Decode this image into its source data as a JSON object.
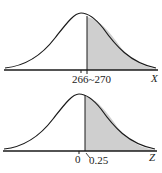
{
  "colors": {
    "curve": "#1a1a1a",
    "shade": "#cfcfcf",
    "axis": "#1a1a1a",
    "background": "#ffffff"
  },
  "top_panel": {
    "axis_label": "X",
    "tick_labels": [
      "266",
      "270"
    ],
    "tick_text": "266~270",
    "mean": 266,
    "shade_from": 270,
    "shaded_region": "right tail"
  },
  "bottom_panel": {
    "axis_label": "Z",
    "tick_labels": [
      "0",
      "0.25"
    ],
    "mean": 0,
    "shade_from": 0.25,
    "shaded_region": "right tail"
  }
}
